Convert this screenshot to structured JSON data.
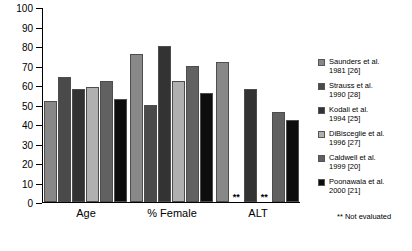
{
  "chart_data": {
    "type": "bar",
    "title": "",
    "xlabel": "",
    "ylabel": "",
    "ylim": [
      0,
      100
    ],
    "ytick_step": 10,
    "yticks": [
      0,
      10,
      20,
      30,
      40,
      50,
      60,
      70,
      80,
      90,
      100
    ],
    "grid": false,
    "legend_position": "right",
    "categories": [
      "Age",
      "% Female",
      "ALT"
    ],
    "series": [
      {
        "name": "Saunders et al. 1981 [26]",
        "name_line1": "Saunders et al.",
        "name_line2": "1981 [26]",
        "color": "#888888",
        "values": [
          52,
          76,
          72
        ]
      },
      {
        "name": "Strauss et al. 1990 [28]",
        "name_line1": "Strauss et al.",
        "name_line2": "1990 [28]",
        "color": "#4a4a4a",
        "values": [
          64,
          50,
          null
        ]
      },
      {
        "name": "Kodali et al. 1994 [25]",
        "name_line1": "Kodali et al.",
        "name_line2": "1994 [25]",
        "color": "#333333",
        "values": [
          58,
          80,
          58
        ]
      },
      {
        "name": "DiBisceglie et al. 1996 [27]",
        "name_line1": "DiBisceglie et al.",
        "name_line2": "1996 [27]",
        "color": "#b0b0b0",
        "values": [
          59,
          62,
          null
        ]
      },
      {
        "name": "Caldwell et al. 1999 [20]",
        "name_line1": "Caldwell et al.",
        "name_line2": "1999 [20]",
        "color": "#616161",
        "values": [
          62,
          70,
          46
        ]
      },
      {
        "name": "Poonawala et al. 2000 [21]",
        "name_line1": "Poonawala et al.",
        "name_line2": "2000 [21]",
        "color": "#0d0d0d",
        "values": [
          53,
          56,
          42
        ]
      }
    ],
    "not_evaluated_marker": "**",
    "footnote": "** Not evaluated"
  }
}
